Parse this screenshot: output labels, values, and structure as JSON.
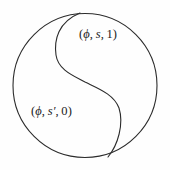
{
  "figure": {
    "type": "yin-yang-diagram",
    "background_color": "#fefefe",
    "stroke_color": "#2b2b2b",
    "stroke_width": 1,
    "circle": {
      "center_x": 85,
      "center_y": 85.5,
      "radius": 72
    },
    "s_curve": {
      "start_x": 80,
      "start_y": 13,
      "end_x": 108,
      "end_y": 157,
      "upper_bulge_x": 55,
      "lower_bulge_x": 122,
      "inflection_x": 85,
      "inflection_y": 82
    }
  },
  "labels": {
    "top": {
      "full_text": "(ϕ, s, 1)",
      "open_paren": "(",
      "phi": "ϕ",
      "comma1": ", ",
      "state": "s",
      "comma2": ", ",
      "value": "1",
      "close_paren": ")"
    },
    "bottom": {
      "full_text": "(ϕ, s′, 0)",
      "open_paren": "(",
      "phi": "ϕ",
      "comma1": ", ",
      "state": "s",
      "prime": "′",
      "comma2": ", ",
      "value": "0",
      "close_paren": ")"
    }
  }
}
